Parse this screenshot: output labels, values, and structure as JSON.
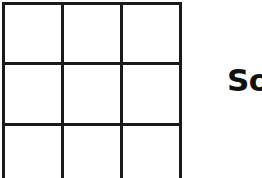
{
  "grid": {
    "rows": 3,
    "columns": 3,
    "line_color": "#1a1a1a",
    "cells": [
      "",
      "",
      "",
      "",
      "",
      "",
      "",
      "",
      ""
    ]
  },
  "label": {
    "text": "So"
  }
}
